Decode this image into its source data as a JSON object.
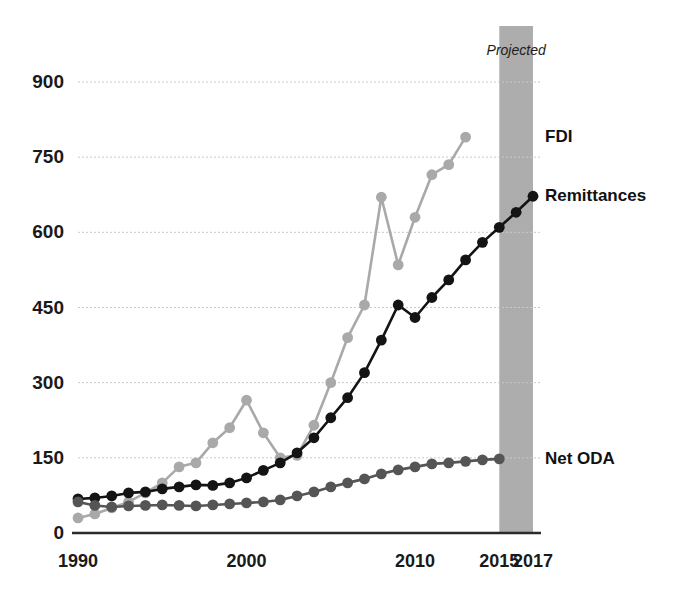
{
  "chart_data": {
    "type": "line",
    "title": "",
    "subtitle": "",
    "xlabel": "",
    "ylabel": "",
    "grid": true,
    "legend_position": "right-inline",
    "xlim": [
      1990,
      2017
    ],
    "ylim": [
      0,
      900
    ],
    "y_ticks": [
      0,
      150,
      300,
      450,
      600,
      750,
      900
    ],
    "y_tick_labels": [
      "0",
      "150",
      "300",
      "450",
      "600",
      "750",
      "900"
    ],
    "x_ticks": [
      1990,
      2000,
      2010,
      2015,
      2017
    ],
    "x_tick_labels": [
      "1990",
      "2000",
      "2010",
      "2015",
      "2017"
    ],
    "x": [
      1990,
      1991,
      1992,
      1993,
      1994,
      1995,
      1996,
      1997,
      1998,
      1999,
      2000,
      2001,
      2002,
      2003,
      2004,
      2005,
      2006,
      2007,
      2008,
      2009,
      2010,
      2011,
      2012,
      2013,
      2014,
      2015,
      2016,
      2017
    ],
    "annotations": [
      {
        "name": "projected-band",
        "label": "Projected",
        "x_start": 2015,
        "x_end": 2017,
        "color": "#adadad"
      }
    ],
    "series": [
      {
        "name": "FDI",
        "label": "FDI",
        "color": "#a9a9a9",
        "marker": "circle",
        "label_value": 790,
        "values": [
          30,
          38,
          50,
          62,
          80,
          100,
          132,
          140,
          180,
          210,
          265,
          200,
          150,
          155,
          215,
          300,
          390,
          455,
          670,
          535,
          630,
          715,
          735,
          790,
          null,
          null,
          null,
          null
        ]
      },
      {
        "name": "Remittances",
        "label": "Remittances",
        "color": "#141414",
        "marker": "circle",
        "label_value": 672,
        "values": [
          68,
          70,
          74,
          80,
          82,
          88,
          92,
          96,
          95,
          100,
          110,
          125,
          140,
          160,
          190,
          230,
          270,
          320,
          385,
          455,
          430,
          470,
          505,
          545,
          580,
          610,
          640,
          672
        ]
      },
      {
        "name": "Net ODA",
        "label": "Net ODA",
        "color": "#555555",
        "marker": "circle",
        "label_value": 148,
        "values": [
          62,
          55,
          52,
          54,
          55,
          56,
          55,
          54,
          56,
          58,
          60,
          62,
          66,
          74,
          82,
          92,
          100,
          108,
          118,
          126,
          132,
          138,
          140,
          143,
          146,
          148,
          null,
          null
        ]
      }
    ]
  },
  "layout": {
    "plot_left": 78,
    "plot_right": 533,
    "plot_top": 82,
    "plot_bottom": 533,
    "band_top": 26,
    "projected_label_text": "Projected"
  }
}
